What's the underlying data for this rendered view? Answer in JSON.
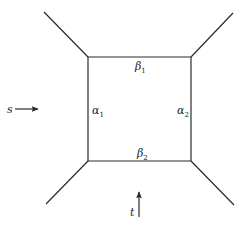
{
  "diagram": {
    "colors": {
      "line": "#2a2a2a",
      "text": "#222222",
      "background": "#ffffff"
    },
    "internal_lines": {
      "top": {
        "symbol": "β",
        "subscript": "1"
      },
      "bottom": {
        "symbol": "β",
        "subscript": "2"
      },
      "left": {
        "symbol": "α",
        "subscript": "1"
      },
      "right": {
        "symbol": "α",
        "subscript": "2"
      }
    },
    "external_legs": [
      "top-left",
      "top-right",
      "bottom-left",
      "bottom-right"
    ],
    "channels": {
      "s": {
        "label": "s",
        "arrow_direction": "right"
      },
      "t": {
        "label": "t",
        "arrow_direction": "up"
      }
    }
  }
}
